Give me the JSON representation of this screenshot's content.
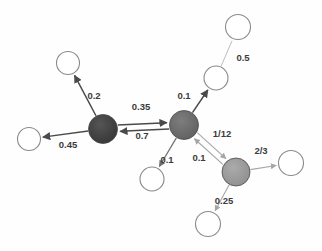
{
  "figure": {
    "type": "graph-diagram",
    "title": "",
    "background_color": "#fefefe",
    "width": 322,
    "height": 251
  },
  "palette": {
    "node_dark": "#3d3d3d",
    "node_medium": "#6b6b6b",
    "node_light": "#9a9a9a",
    "node_open_fill": "#ffffff",
    "node_open_stroke": "#8a8a8a",
    "edge_dark": "#4a4a4a",
    "edge_light": "#a6a6a6",
    "label_color": "#3c3c3c"
  },
  "chart_data": {
    "type": "graph",
    "title": "",
    "xlabel": "",
    "ylabel": "",
    "nodes": [
      {
        "id": "n-dark",
        "kind": "filled",
        "shade": "dark",
        "cx": 103,
        "cy": 129,
        "r": 14.5
      },
      {
        "id": "n-center",
        "kind": "filled",
        "shade": "medium",
        "cx": 184,
        "cy": 125,
        "r": 14.5
      },
      {
        "id": "n-lower-right",
        "kind": "filled",
        "shade": "light",
        "cx": 236,
        "cy": 172,
        "r": 14.0
      },
      {
        "id": "o-top-left",
        "kind": "open",
        "cx": 68,
        "cy": 63,
        "r": 11.5
      },
      {
        "id": "o-left",
        "kind": "open",
        "cx": 29,
        "cy": 139,
        "r": 11.5
      },
      {
        "id": "o-below-center",
        "kind": "open",
        "cx": 152,
        "cy": 179,
        "r": 12.0
      },
      {
        "id": "o-upper-right",
        "kind": "open",
        "cx": 216,
        "cy": 78,
        "r": 12.0
      },
      {
        "id": "o-top-right",
        "kind": "open",
        "cx": 238,
        "cy": 27,
        "r": 12.5
      },
      {
        "id": "o-far-right",
        "kind": "open",
        "cx": 291,
        "cy": 163,
        "r": 12.5
      },
      {
        "id": "o-bottom",
        "kind": "open",
        "cx": 208,
        "cy": 224,
        "r": 12.5
      }
    ],
    "edges": [
      {
        "id": "e1",
        "from": "n-dark",
        "to": "o-top-left",
        "weight": "0.2",
        "label_x": 94,
        "label_y": 96,
        "style": "dark",
        "arrow": true
      },
      {
        "id": "e2",
        "from": "n-dark",
        "to": "o-left",
        "weight": "0.45",
        "label_x": 68,
        "label_y": 145,
        "style": "dark",
        "arrow": true
      },
      {
        "id": "e3",
        "from": "n-dark",
        "to": "n-center",
        "weight": "0.35",
        "label_x": 141,
        "label_y": 107,
        "style": "dark",
        "arrow": true
      },
      {
        "id": "e4",
        "from": "n-center",
        "to": "n-dark",
        "weight": "0.7",
        "label_x": 142,
        "label_y": 136,
        "style": "dark",
        "arrow": true
      },
      {
        "id": "e5",
        "from": "n-center",
        "to": "o-upper-right",
        "weight": "0.1",
        "label_x": 184,
        "label_y": 96,
        "style": "dark",
        "arrow": true
      },
      {
        "id": "e6",
        "from": "n-center",
        "to": "o-below-center",
        "weight": "0.1",
        "label_x": 167,
        "label_y": 160,
        "style": "mid",
        "arrow": true
      },
      {
        "id": "e7",
        "from": "n-center",
        "to": "n-lower-right",
        "weight": "0.1",
        "label_x": 199,
        "label_y": 158,
        "style": "light",
        "arrow": true
      },
      {
        "id": "e8",
        "from": "n-lower-right",
        "to": "n-center",
        "weight": "1/12",
        "label_x": 222,
        "label_y": 134,
        "style": "light",
        "arrow": true
      },
      {
        "id": "e9",
        "from": "n-lower-right",
        "to": "o-far-right",
        "weight": "2/3",
        "label_x": 261,
        "label_y": 151,
        "style": "light",
        "arrow": true
      },
      {
        "id": "e10",
        "from": "n-lower-right",
        "to": "o-bottom",
        "weight": "0.25",
        "label_x": 224,
        "label_y": 201,
        "style": "light",
        "arrow": true
      },
      {
        "id": "e11",
        "from": "o-upper-right",
        "to": "o-top-right",
        "weight": "0.5",
        "label_x": 243,
        "label_y": 58,
        "style": "faint",
        "arrow": false
      }
    ],
    "labels": [
      "0.2",
      "0.45",
      "0.35",
      "0.7",
      "0.1",
      "0.1",
      "0.1",
      "1/12",
      "2/3",
      "0.25",
      "0.5"
    ],
    "legend": [],
    "grid": false
  }
}
